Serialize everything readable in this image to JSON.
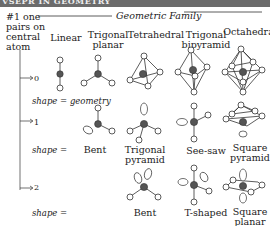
{
  "banner": {
    "text": "VSEPR IN GEOMETRY"
  },
  "header": {
    "left_label": [
      "#1 one",
      "pairs on",
      "central",
      "atom"
    ],
    "family_title": "Geometric Family"
  },
  "columns": [
    {
      "label": [
        "Linear"
      ]
    },
    {
      "label": [
        "Trigonal",
        "planar"
      ]
    },
    {
      "label": [
        "Tetrahedral"
      ]
    },
    {
      "label": [
        "Trigonal",
        "bipyramid"
      ]
    },
    {
      "label": [
        "Octahedral"
      ]
    }
  ],
  "rows": [
    {
      "count": "0",
      "shape_caption": "shape = geometry",
      "shapes": []
    },
    {
      "count": "1",
      "shape_caption": "shape =",
      "shapes": [
        {
          "label": [
            "Bent"
          ]
        },
        {
          "label": [
            "Trigonal",
            "pyramid"
          ]
        },
        {
          "label": [
            "See-saw"
          ]
        },
        {
          "label": [
            "Square",
            "pyramid"
          ]
        }
      ]
    },
    {
      "count": "2",
      "shape_caption": "shape =",
      "shapes": [
        {
          "label": [
            "Bent"
          ]
        },
        {
          "label": [
            "T-shaped"
          ]
        },
        {
          "label": [
            "Square",
            "planar"
          ]
        }
      ]
    }
  ],
  "colors": {
    "central_atom": "#555555",
    "bond": "#333333",
    "outer_atom_fill": "#ffffff",
    "banner": "#6b6b6b"
  }
}
